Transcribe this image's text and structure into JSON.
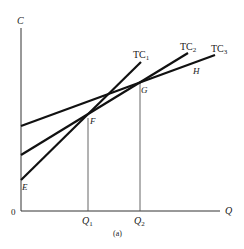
{
  "figure": {
    "caption": "(a)",
    "axes": {
      "y_label": "C",
      "x_label": "Q",
      "origin_label": "0"
    },
    "curves": [
      {
        "name": "TC",
        "sub": "1"
      },
      {
        "name": "TC",
        "sub": "2"
      },
      {
        "name": "TC",
        "sub": "3"
      }
    ],
    "points": {
      "E": "E",
      "F": "F",
      "G": "G",
      "H": "H"
    },
    "x_ticks": [
      {
        "name": "Q",
        "sub": "1"
      },
      {
        "name": "Q",
        "sub": "2"
      }
    ],
    "colors": {
      "line": "#111111",
      "guide": "#555555"
    }
  }
}
